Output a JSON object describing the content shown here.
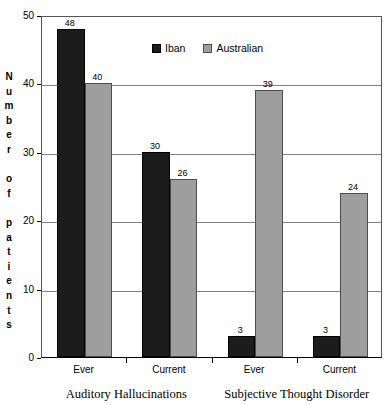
{
  "chart_data": {
    "type": "bar",
    "title": "",
    "subtitle": "",
    "xlabel": "",
    "ylabel": "Number of patients",
    "ylim": [
      0,
      50
    ],
    "ytick_labels": [
      "0",
      "10",
      "20",
      "30",
      "40",
      "50"
    ],
    "ytick_values": [
      0,
      10,
      20,
      30,
      40,
      50
    ],
    "grid": true,
    "grid_axis": "y",
    "legend_position": "top-center",
    "categories": [
      "Ever",
      "Current",
      "Ever",
      "Current"
    ],
    "groups": [
      {
        "label": "Auditory Hallucinations",
        "categories": [
          "Ever",
          "Current"
        ]
      },
      {
        "label": "Subjective Thought Disorder",
        "categories": [
          "Ever",
          "Current"
        ]
      }
    ],
    "series": [
      {
        "name": "Iban",
        "color": "#1c1c1c",
        "values": [
          48,
          30,
          3,
          3
        ]
      },
      {
        "name": "Australian",
        "color": "#9e9e9e",
        "values": [
          40,
          26,
          39,
          24
        ]
      }
    ],
    "data_labels": [
      {
        "series": "Iban",
        "category": "Ever",
        "group": "Auditory Hallucinations",
        "value": 48
      },
      {
        "series": "Australian",
        "category": "Ever",
        "group": "Auditory Hallucinations",
        "value": 40
      },
      {
        "series": "Iban",
        "category": "Current",
        "group": "Auditory Hallucinations",
        "value": 30
      },
      {
        "series": "Australian",
        "category": "Current",
        "group": "Auditory Hallucinations",
        "value": 26
      },
      {
        "series": "Iban",
        "category": "Ever",
        "group": "Subjective Thought Disorder",
        "value": 3
      },
      {
        "series": "Australian",
        "category": "Ever",
        "group": "Subjective Thought Disorder",
        "value": 39
      },
      {
        "series": "Iban",
        "category": "Current",
        "group": "Subjective Thought Disorder",
        "value": 3
      },
      {
        "series": "Australian",
        "category": "Current",
        "group": "Subjective Thought Disorder",
        "value": 24
      }
    ]
  },
  "axis": {
    "y_title_letters": [
      "N",
      "u",
      "m",
      "b",
      "e",
      "r",
      "",
      "o",
      "f",
      "",
      "p",
      "a",
      "t",
      "i",
      "e",
      "n",
      "t",
      "s"
    ]
  },
  "legend": {
    "items": [
      {
        "label": "Iban",
        "color": "#1c1c1c"
      },
      {
        "label": "Australian",
        "color": "#9e9e9e"
      }
    ]
  },
  "colors": {
    "iban": "#1c1c1c",
    "australian": "#9e9e9e",
    "gridline": "#808080",
    "axis": "#000000",
    "background": "#ffffff"
  }
}
